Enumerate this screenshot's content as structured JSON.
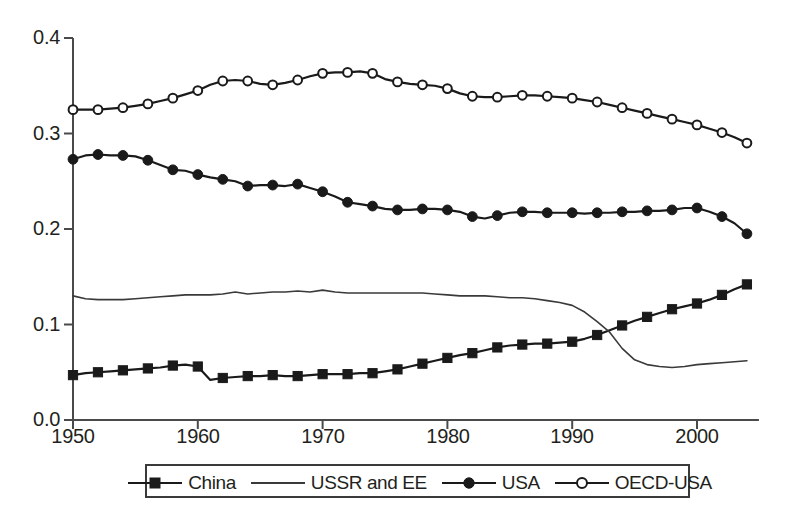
{
  "chart_data": {
    "type": "line",
    "title": "",
    "xlabel": "",
    "ylabel": "",
    "xlim": [
      1950,
      2004
    ],
    "ylim": [
      0.0,
      0.4
    ],
    "grid": false,
    "legend_position": "bottom",
    "xticks": [
      "1950",
      "1960",
      "1970",
      "1980",
      "1990",
      "2000"
    ],
    "xtick_values": [
      1950,
      1960,
      1970,
      1980,
      1990,
      2000
    ],
    "yticks": [
      "0.0",
      "0.1",
      "0.2",
      "0.3",
      "0.4"
    ],
    "ytick_values": [
      0.0,
      0.1,
      0.2,
      0.3,
      0.4
    ],
    "x": [
      1950,
      1951,
      1952,
      1953,
      1954,
      1955,
      1956,
      1957,
      1958,
      1959,
      1960,
      1961,
      1962,
      1963,
      1964,
      1965,
      1966,
      1967,
      1968,
      1969,
      1970,
      1971,
      1972,
      1973,
      1974,
      1975,
      1976,
      1977,
      1978,
      1979,
      1980,
      1981,
      1982,
      1983,
      1984,
      1985,
      1986,
      1987,
      1988,
      1989,
      1990,
      1991,
      1992,
      1993,
      1994,
      1995,
      1996,
      1997,
      1998,
      1999,
      2000,
      2001,
      2002,
      2003,
      2004
    ],
    "series": [
      {
        "name": "China",
        "marker": "filled-square",
        "color": "#1a1a1a",
        "values": [
          0.047,
          0.049,
          0.05,
          0.051,
          0.052,
          0.053,
          0.054,
          0.055,
          0.057,
          0.058,
          0.056,
          0.042,
          0.044,
          0.045,
          0.046,
          0.046,
          0.047,
          0.046,
          0.046,
          0.047,
          0.048,
          0.048,
          0.048,
          0.049,
          0.049,
          0.051,
          0.053,
          0.056,
          0.059,
          0.062,
          0.065,
          0.068,
          0.07,
          0.073,
          0.076,
          0.078,
          0.079,
          0.08,
          0.08,
          0.081,
          0.082,
          0.085,
          0.089,
          0.094,
          0.099,
          0.104,
          0.108,
          0.112,
          0.116,
          0.119,
          0.122,
          0.126,
          0.131,
          0.137,
          0.142
        ]
      },
      {
        "name": "USSR and EE",
        "marker": "none",
        "color": "#3a3a3a",
        "values": [
          0.13,
          0.127,
          0.126,
          0.126,
          0.126,
          0.127,
          0.128,
          0.129,
          0.13,
          0.131,
          0.131,
          0.131,
          0.132,
          0.134,
          0.132,
          0.133,
          0.134,
          0.134,
          0.135,
          0.134,
          0.136,
          0.134,
          0.133,
          0.133,
          0.133,
          0.133,
          0.133,
          0.133,
          0.133,
          0.132,
          0.131,
          0.13,
          0.13,
          0.13,
          0.129,
          0.128,
          0.128,
          0.127,
          0.125,
          0.123,
          0.12,
          0.113,
          0.103,
          0.092,
          0.075,
          0.063,
          0.058,
          0.056,
          0.055,
          0.056,
          0.058,
          0.059,
          0.06,
          0.061,
          0.062
        ]
      },
      {
        "name": "USA",
        "marker": "filled-circle",
        "color": "#1a1a1a",
        "values": [
          0.273,
          0.277,
          0.278,
          0.277,
          0.277,
          0.276,
          0.272,
          0.267,
          0.262,
          0.261,
          0.257,
          0.254,
          0.252,
          0.25,
          0.245,
          0.246,
          0.246,
          0.245,
          0.247,
          0.243,
          0.239,
          0.234,
          0.228,
          0.226,
          0.224,
          0.221,
          0.22,
          0.22,
          0.221,
          0.221,
          0.22,
          0.218,
          0.213,
          0.211,
          0.214,
          0.217,
          0.218,
          0.218,
          0.217,
          0.217,
          0.217,
          0.216,
          0.217,
          0.217,
          0.218,
          0.218,
          0.219,
          0.219,
          0.22,
          0.222,
          0.222,
          0.218,
          0.213,
          0.206,
          0.195
        ]
      },
      {
        "name": "OECD-USA",
        "marker": "open-circle",
        "color": "#1a1a1a",
        "values": [
          0.325,
          0.325,
          0.325,
          0.326,
          0.327,
          0.329,
          0.331,
          0.334,
          0.337,
          0.341,
          0.345,
          0.351,
          0.355,
          0.356,
          0.355,
          0.352,
          0.351,
          0.353,
          0.356,
          0.36,
          0.363,
          0.364,
          0.364,
          0.365,
          0.363,
          0.357,
          0.354,
          0.352,
          0.351,
          0.35,
          0.347,
          0.342,
          0.339,
          0.338,
          0.338,
          0.339,
          0.34,
          0.34,
          0.339,
          0.338,
          0.337,
          0.335,
          0.333,
          0.33,
          0.327,
          0.324,
          0.321,
          0.318,
          0.315,
          0.312,
          0.309,
          0.305,
          0.301,
          0.296,
          0.29
        ]
      }
    ]
  },
  "legend": {
    "items": [
      {
        "label": "China",
        "marker": "filled-square"
      },
      {
        "label": "USSR and EE",
        "marker": "none"
      },
      {
        "label": "USA",
        "marker": "filled-circle"
      },
      {
        "label": "OECD-USA",
        "marker": "open-circle"
      }
    ]
  },
  "axis": {
    "color": "#4a4a4a"
  }
}
